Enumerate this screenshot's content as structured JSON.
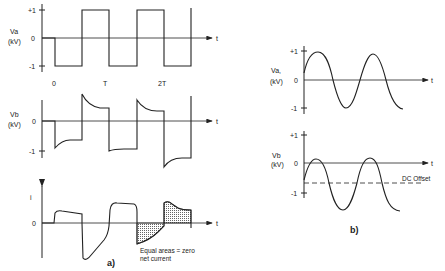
{
  "figure": {
    "panel_a": {
      "caption": "a)",
      "time_labels": [
        "0",
        "T",
        "2T"
      ],
      "va_plot": {
        "ylabel": "Va",
        "yunit": "(kV)",
        "ticks": [
          "+1",
          "0",
          "-1"
        ],
        "xlabel": "t",
        "waveform": "square"
      },
      "vb_plot": {
        "ylabel": "Vb",
        "yunit": "(kV)",
        "ticks": [
          "0",
          "-1"
        ],
        "xlabel": "t",
        "waveform": "distorted-square"
      },
      "i_plot": {
        "ylabel": "i",
        "ticks": [
          "0"
        ],
        "xlabel": "t",
        "annotation_line1": "Equal areas = zero",
        "annotation_line2": "net current"
      }
    },
    "panel_b": {
      "caption": "b)",
      "va_plot": {
        "ylabel": "Va,",
        "yunit": "(kV)",
        "ticks": [
          "+1",
          "0",
          "-1"
        ],
        "xlabel": "t",
        "waveform": "sine"
      },
      "vb_plot": {
        "ylabel": "Vb",
        "yunit": "(kV)",
        "ticks": [
          "+1",
          "0",
          "-1"
        ],
        "xlabel": "t",
        "waveform": "sine-offset",
        "dc_label": "DC Offset"
      }
    },
    "colors": {
      "ink": "#222222",
      "hatch": "#888888",
      "background": "#ffffff"
    }
  }
}
